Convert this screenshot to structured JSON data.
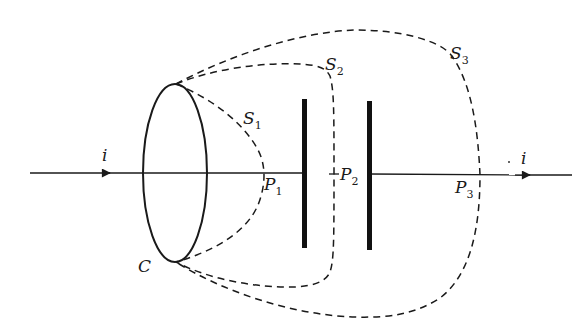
{
  "diagram": {
    "colors": {
      "ink": "#1a1a1a",
      "background": "#ffffff"
    },
    "labels": {
      "current_in": "i",
      "current_out": "i",
      "loop": "C",
      "surface1": {
        "main": "S",
        "sub": "1"
      },
      "surface2": {
        "main": "S",
        "sub": "2"
      },
      "surface3": {
        "main": "S",
        "sub": "3"
      },
      "point1": {
        "main": "P",
        "sub": "1"
      },
      "point2": {
        "main": "P",
        "sub": "2"
      },
      "point3": {
        "main": "P",
        "sub": "3"
      }
    },
    "elements": [
      "wire with current arrow (left)",
      "elliptical loop C",
      "capacitor left plate",
      "capacitor right plate",
      "wire with current arrow (right)",
      "dashed surface S1 crossing wire at P1",
      "dashed surface S2 passing between plates at P2",
      "dashed surface S3 crossing wire at P3"
    ]
  }
}
